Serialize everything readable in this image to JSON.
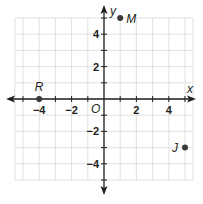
{
  "chart_data": {
    "type": "scatter",
    "title": "",
    "xlabel": "x",
    "ylabel": "y",
    "origin_label": "O",
    "xlim": [
      -5,
      5
    ],
    "ylim": [
      -5,
      5
    ],
    "grid": true,
    "x_ticks": [
      -4,
      -2,
      2,
      4
    ],
    "x_tick_labels": [
      "−4",
      "−2",
      "2",
      "4"
    ],
    "y_ticks": [
      4,
      2,
      -2,
      -4
    ],
    "y_tick_labels": [
      "4",
      "2",
      "−2",
      "−4"
    ],
    "points": [
      {
        "name": "R",
        "x": -4,
        "y": 0
      },
      {
        "name": "M",
        "x": 1,
        "y": 5
      },
      {
        "name": "J",
        "x": 5,
        "y": -3
      }
    ]
  },
  "colors": {
    "grid": "#d9d9d9",
    "axis": "#231f20",
    "point": "#3a3a3a"
  }
}
